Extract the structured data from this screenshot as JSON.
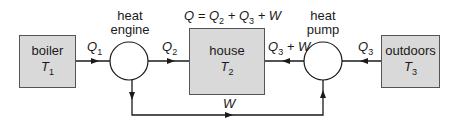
{
  "diagram": {
    "nodes": {
      "boiler": {
        "label": "boiler",
        "temp_symbol": "T",
        "temp_sub": "1"
      },
      "heat_engine": {
        "label_line1": "heat",
        "label_line2": "engine"
      },
      "house": {
        "label": "house",
        "temp_symbol": "T",
        "temp_sub": "2"
      },
      "heat_pump": {
        "label_line1": "heat",
        "label_line2": "pump"
      },
      "outdoors": {
        "label": "outdoors",
        "temp_symbol": "T",
        "temp_sub": "3"
      }
    },
    "flows": {
      "q1": {
        "sym": "Q",
        "sub": "1"
      },
      "q2": {
        "sym": "Q",
        "sub": "2"
      },
      "q3_plus_w": {
        "sym": "Q",
        "sub": "3",
        "suffix": " + W"
      },
      "q3": {
        "sym": "Q",
        "sub": "3"
      },
      "w": {
        "sym": "W"
      }
    },
    "equation": {
      "lhs": "Q = Q",
      "s2": "2",
      "mid": " + Q",
      "s3": "3",
      "rhs": " + W"
    },
    "colors": {
      "box_fill": "#d9d9d9",
      "line": "#1a1a1a",
      "background": "#ffffff"
    }
  }
}
